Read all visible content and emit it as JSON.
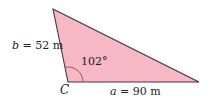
{
  "diagram": {
    "type": "triangle",
    "fill_color": "#f5b8c4",
    "stroke_color": "#3a3a3a",
    "arc_color": "#a0404a",
    "vertices": {
      "top": [
        53,
        9
      ],
      "C": [
        68,
        82
      ],
      "right": [
        199,
        82
      ]
    },
    "vertex_label": "C",
    "angle": {
      "label": "102°",
      "value": 102,
      "at": "C"
    },
    "sides": {
      "b": {
        "variable": "b",
        "equals": " = 52 m",
        "length": 52,
        "unit": "m"
      },
      "a": {
        "variable": "a",
        "equals": " = 90 m",
        "length": 90,
        "unit": "m"
      }
    }
  }
}
